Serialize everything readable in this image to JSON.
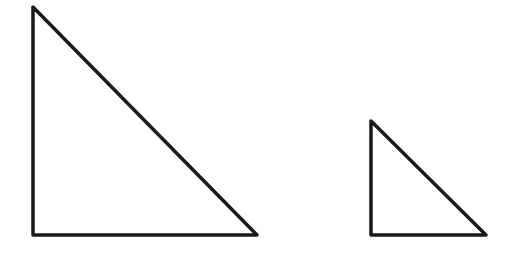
{
  "diagram": {
    "stroke_color": "#1a1a1a",
    "background": "#ffffff",
    "shapes": [
      {
        "name": "large-right-triangle",
        "type": "right-triangle",
        "vertices": [
          [
            33,
            7
          ],
          [
            33,
            235
          ],
          [
            257,
            235
          ]
        ],
        "right_angle_at": [
          33,
          235
        ]
      },
      {
        "name": "small-right-triangle",
        "type": "right-triangle",
        "vertices": [
          [
            371,
            121
          ],
          [
            371,
            235
          ],
          [
            486,
            235
          ]
        ],
        "right_angle_at": [
          371,
          235
        ]
      }
    ]
  }
}
